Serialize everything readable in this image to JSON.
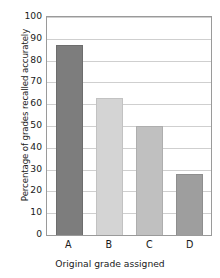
{
  "chart_data": {
    "type": "bar",
    "title": "",
    "categories": [
      "A",
      "B",
      "C",
      "D"
    ],
    "values": [
      87,
      63,
      50,
      28
    ],
    "series": [
      {
        "name": "Percentage of grades recalled accurately",
        "values": [
          87,
          63,
          50,
          28
        ]
      }
    ],
    "xlabel": "Original grade assigned",
    "ylabel": "Percentage of grades recalled accurately",
    "ylim": [
      0,
      100
    ],
    "ytick_labels": [
      "0",
      "10",
      "20",
      "30",
      "40",
      "50",
      "60",
      "70",
      "80",
      "90",
      "100"
    ],
    "ytick_values": [
      0,
      10,
      20,
      30,
      40,
      50,
      60,
      70,
      80,
      90,
      100
    ],
    "grid": true,
    "grid_axis": "y",
    "legend": "none",
    "bar_colors": [
      "#7d7d7d",
      "#d4d4d4",
      "#c0c0c0",
      "#9e9e9e"
    ],
    "bar_edge_colors": [
      "#6d6d6d",
      "#c2c2c2",
      "#aeaeae",
      "#8e8e8e"
    ],
    "grid_color": "#cfcfcf",
    "axis_color": "#9a9a9a",
    "background_color": "#ffffff"
  }
}
